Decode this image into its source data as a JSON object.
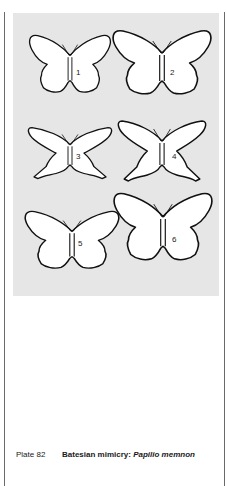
{
  "plate": {
    "background_color": "#e6e6e6",
    "figures": [
      {
        "label": "1",
        "type": "rounded"
      },
      {
        "label": "2",
        "type": "rounded"
      },
      {
        "label": "3",
        "type": "swallowtail-narrow"
      },
      {
        "label": "4",
        "type": "swallowtail"
      },
      {
        "label": "5",
        "type": "rounded"
      },
      {
        "label": "6",
        "type": "rounded"
      }
    ]
  },
  "caption": {
    "plate_number": "Plate 82",
    "title_plain": "Batesian mimicry: ",
    "title_italic": "Papilio memnon"
  }
}
